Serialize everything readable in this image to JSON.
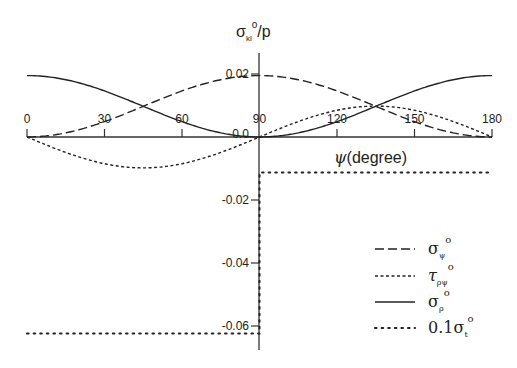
{
  "chart_data": {
    "type": "line",
    "title": "",
    "ylabel": "σ_kl^0/p",
    "xlabel": "ψ(degree)",
    "xlim": [
      0,
      180
    ],
    "ylim": [
      -0.065,
      0.025
    ],
    "x_ticks": [
      "0",
      "30",
      "60",
      "90",
      "120",
      "150",
      "180"
    ],
    "y_ticks": [
      "0.02",
      "0.0",
      "-0.02",
      "-0.04",
      "-0.06"
    ],
    "grid": false,
    "legend_position": "lower right",
    "x": [
      0,
      15,
      30,
      45,
      60,
      75,
      90,
      105,
      120,
      135,
      150,
      165,
      180
    ],
    "series": [
      {
        "name": "σ_ψ^0",
        "style": "long-dash",
        "values": [
          0.0,
          0.0013,
          0.0049,
          0.0098,
          0.0146,
          0.0182,
          0.0195,
          0.0182,
          0.0146,
          0.0098,
          0.0049,
          0.0013,
          0.0
        ]
      },
      {
        "name": "τ_ρψ^0",
        "style": "short-dash",
        "values": [
          0.0,
          -0.0049,
          -0.0085,
          -0.0098,
          -0.0085,
          -0.0049,
          0.0,
          0.0049,
          0.0085,
          0.0098,
          0.0085,
          0.0049,
          0.0
        ]
      },
      {
        "name": "σ_ρ^0",
        "style": "solid",
        "values": [
          0.0195,
          0.0182,
          0.0146,
          0.0098,
          0.0049,
          0.0013,
          0.0,
          0.0013,
          0.0049,
          0.0098,
          0.0146,
          0.0182,
          0.0195
        ]
      },
      {
        "name": "0.1σ_t^0",
        "style": "dotted",
        "segments": [
          {
            "x_range": [
              0,
              90
            ],
            "value": -0.0624
          },
          {
            "x_at": 90,
            "from": -0.0624,
            "to": -0.0113
          },
          {
            "x_range": [
              90,
              180
            ],
            "value": -0.0113
          }
        ]
      }
    ]
  },
  "labels": {
    "y_axis_title": {
      "main": "σ",
      "sub": "kl",
      "sup": "o",
      "tail": "/p"
    },
    "x_axis_title": {
      "greek": "ψ",
      "text": "(degree)"
    },
    "x_ticks": [
      "0",
      "30",
      "60",
      "90",
      "120",
      "150",
      "180"
    ],
    "y_ticks_pos": [
      "0.02"
    ],
    "y_zero": "0.0",
    "y_ticks_neg": [
      "-0.02",
      "-0.04",
      "-0.06"
    ]
  },
  "legend": [
    {
      "main": "σ",
      "sub": "ψ",
      "sup": "o",
      "prefix": ""
    },
    {
      "main": "τ",
      "sub": "ρψ",
      "sup": "o",
      "prefix": ""
    },
    {
      "main": "σ",
      "sub": "ρ",
      "sup": "o",
      "prefix": ""
    },
    {
      "main": "σ",
      "sub": "t",
      "sup": "o",
      "prefix": "0.1"
    }
  ]
}
